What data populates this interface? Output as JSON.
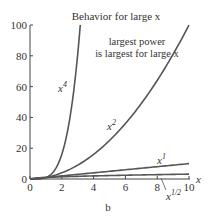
{
  "chart_data": {
    "type": "line",
    "title": "Behavior for large x",
    "annotation": "largest power is largest for large x",
    "annotation_lines": [
      "largest power",
      "is largest for large x"
    ],
    "xlabel": "x",
    "ylabel": "",
    "xlim": [
      0,
      10
    ],
    "ylim": [
      0,
      100
    ],
    "xticks": [
      0,
      2,
      4,
      6,
      8,
      10
    ],
    "yticks": [
      0,
      20,
      40,
      60,
      80,
      100
    ],
    "grid": false,
    "caption": "b",
    "series": [
      {
        "name": "x^4",
        "label_base": "x",
        "label_exp": "4",
        "exponent": 4,
        "x": [
          0,
          0.5,
          1,
          1.5,
          2,
          2.5,
          3,
          3.16
        ],
        "y": [
          0,
          0.06,
          1,
          5.06,
          16,
          39.06,
          81,
          100
        ]
      },
      {
        "name": "x^2",
        "label_base": "x",
        "label_exp": "2",
        "exponent": 2,
        "x": [
          0,
          1,
          2,
          3,
          4,
          5,
          6,
          7,
          8,
          9,
          10
        ],
        "y": [
          0,
          1,
          4,
          9,
          16,
          25,
          36,
          49,
          64,
          81,
          100
        ]
      },
      {
        "name": "x^1",
        "label_base": "x",
        "label_exp": "1",
        "exponent": 1,
        "x": [
          0,
          10
        ],
        "y": [
          0,
          10
        ]
      },
      {
        "name": "x^1/2",
        "label_base": "x",
        "label_exp": "1/2",
        "exponent": 0.5,
        "x": [
          0,
          1,
          2,
          4,
          6,
          8,
          10
        ],
        "y": [
          0,
          1,
          1.41,
          2,
          2.45,
          2.83,
          3.16
        ]
      }
    ]
  }
}
